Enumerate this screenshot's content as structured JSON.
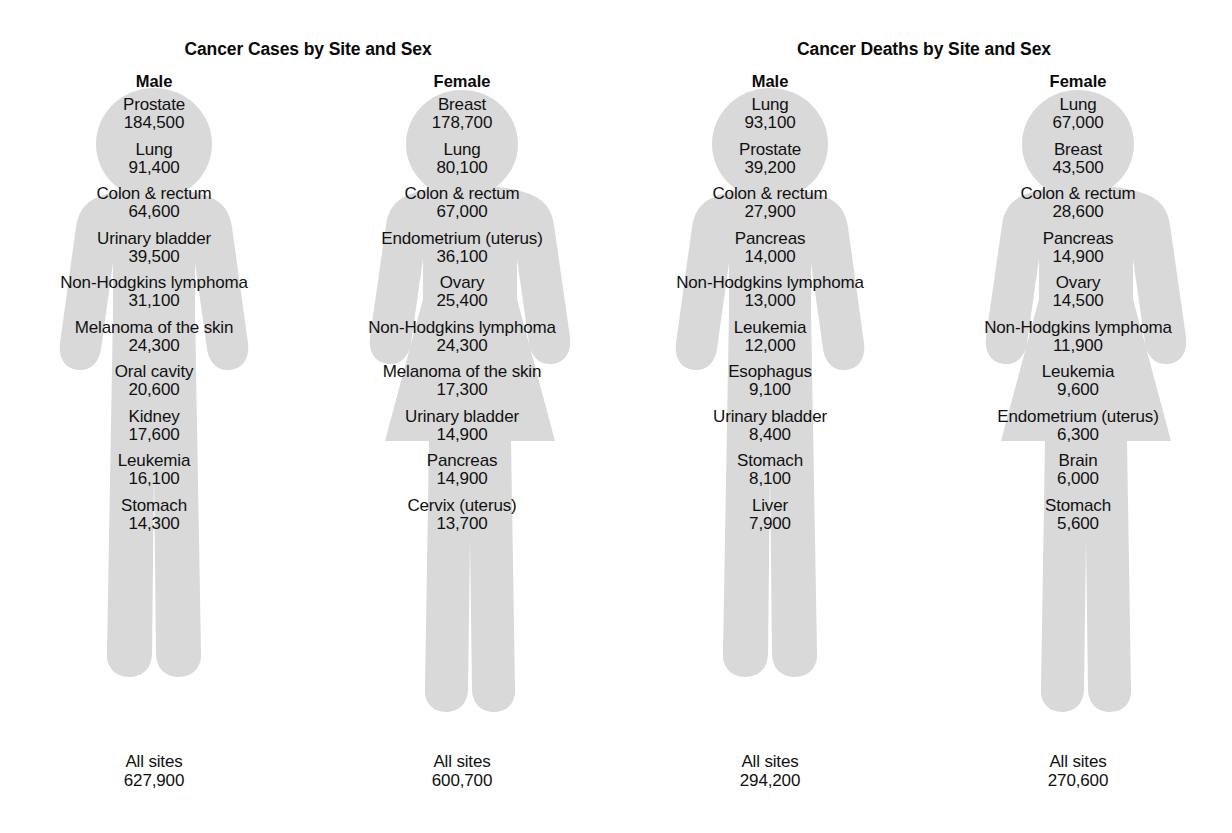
{
  "colors": {
    "figure_fill": "#d9d9d9",
    "text": "#111111",
    "background": "#ffffff"
  },
  "chart_data": {
    "type": "table",
    "note": "Pictogram: ranked cancer site lists overlaid on male and female human silhouettes",
    "panels": [
      {
        "title": "Cancer Cases by Site and Sex",
        "figures": [
          {
            "sex": "Male",
            "shape": "male",
            "items": [
              {
                "site": "Prostate",
                "value": "184,500"
              },
              {
                "site": "Lung",
                "value": "91,400"
              },
              {
                "site": "Colon & rectum",
                "value": "64,600"
              },
              {
                "site": "Urinary bladder",
                "value": "39,500"
              },
              {
                "site": "Non-Hodgkins lymphoma",
                "value": "31,100"
              },
              {
                "site": "Melanoma of the skin",
                "value": "24,300"
              },
              {
                "site": "Oral cavity",
                "value": "20,600"
              },
              {
                "site": "Kidney",
                "value": "17,600"
              },
              {
                "site": "Leukemia",
                "value": "16,100"
              },
              {
                "site": "Stomach",
                "value": "14,300"
              }
            ],
            "total": {
              "site": "All sites",
              "value": "627,900"
            }
          },
          {
            "sex": "Female",
            "shape": "female",
            "items": [
              {
                "site": "Breast",
                "value": "178,700"
              },
              {
                "site": "Lung",
                "value": "80,100"
              },
              {
                "site": "Colon & rectum",
                "value": "67,000"
              },
              {
                "site": "Endometrium (uterus)",
                "value": "36,100"
              },
              {
                "site": "Ovary",
                "value": "25,400"
              },
              {
                "site": "Non-Hodgkins lymphoma",
                "value": "24,300"
              },
              {
                "site": "Melanoma of the skin",
                "value": "17,300"
              },
              {
                "site": "Urinary bladder",
                "value": "14,900"
              },
              {
                "site": "Pancreas",
                "value": "14,900"
              },
              {
                "site": "Cervix (uterus)",
                "value": "13,700"
              }
            ],
            "total": {
              "site": "All sites",
              "value": "600,700"
            }
          }
        ]
      },
      {
        "title": "Cancer Deaths by Site and Sex",
        "figures": [
          {
            "sex": "Male",
            "shape": "male",
            "items": [
              {
                "site": "Lung",
                "value": "93,100"
              },
              {
                "site": "Prostate",
                "value": "39,200"
              },
              {
                "site": "Colon & rectum",
                "value": "27,900"
              },
              {
                "site": "Pancreas",
                "value": "14,000"
              },
              {
                "site": "Non-Hodgkins lymphoma",
                "value": "13,000"
              },
              {
                "site": "Leukemia",
                "value": "12,000"
              },
              {
                "site": "Esophagus",
                "value": "9,100"
              },
              {
                "site": "Urinary bladder",
                "value": "8,400"
              },
              {
                "site": "Stomach",
                "value": "8,100"
              },
              {
                "site": "Liver",
                "value": "7,900"
              }
            ],
            "total": {
              "site": "All sites",
              "value": "294,200"
            }
          },
          {
            "sex": "Female",
            "shape": "female",
            "items": [
              {
                "site": "Lung",
                "value": "67,000"
              },
              {
                "site": "Breast",
                "value": "43,500"
              },
              {
                "site": "Colon & rectum",
                "value": "28,600"
              },
              {
                "site": "Pancreas",
                "value": "14,900"
              },
              {
                "site": "Ovary",
                "value": "14,500"
              },
              {
                "site": "Non-Hodgkins lymphoma",
                "value": "11,900"
              },
              {
                "site": "Leukemia",
                "value": "9,600"
              },
              {
                "site": "Endometrium (uterus)",
                "value": "6,300"
              },
              {
                "site": "Brain",
                "value": "6,000"
              },
              {
                "site": "Stomach",
                "value": "5,600"
              }
            ],
            "total": {
              "site": "All sites",
              "value": "270,600"
            }
          }
        ]
      }
    ]
  }
}
